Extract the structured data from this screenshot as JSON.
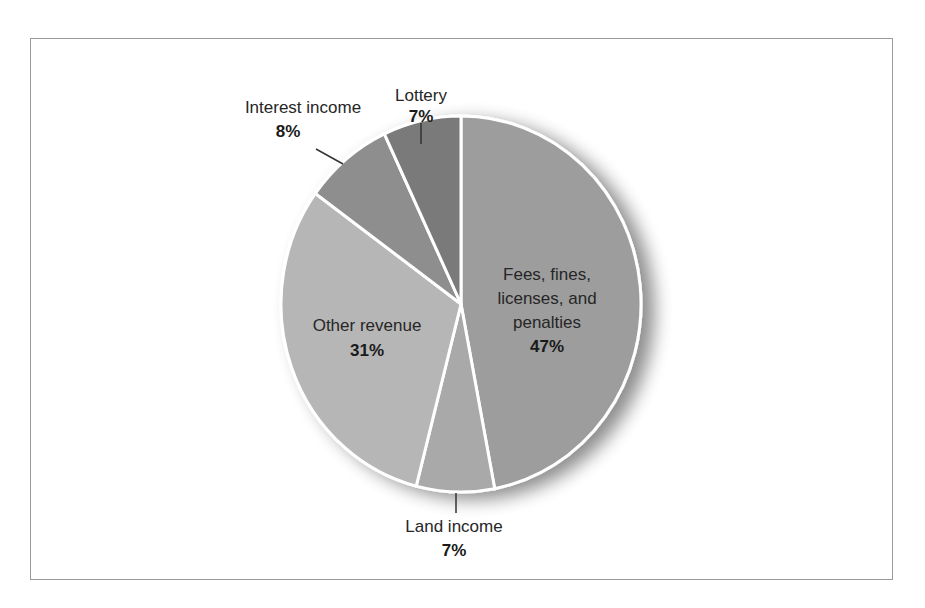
{
  "chart_data": {
    "type": "pie",
    "title": "",
    "categories": [
      "Fees, fines, licenses, and penalties",
      "Land income",
      "Other revenue",
      "Interest income",
      "Lottery"
    ],
    "values": [
      47,
      7,
      31,
      8,
      7
    ],
    "unit": "%",
    "colors": [
      "#9d9d9d",
      "#a9a9a9",
      "#b6b6b6",
      "#8e8e8e",
      "#7a7a7a"
    ],
    "start_angle": "12 o'clock",
    "direction": "clockwise",
    "legend": "none (direct labels)"
  },
  "labels": {
    "fees": {
      "line1": "Fees, fines,",
      "line2": "licenses, and",
      "line3": "penalties",
      "pct": "47%"
    },
    "land": {
      "name": "Land income",
      "pct": "7%"
    },
    "other": {
      "name": "Other revenue",
      "pct": "31%"
    },
    "interest": {
      "name": "Interest income",
      "pct": "8%"
    },
    "lottery": {
      "name": "Lottery",
      "pct": "7%"
    }
  }
}
